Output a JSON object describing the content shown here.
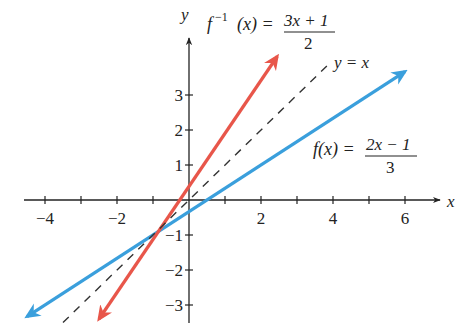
{
  "chart_data": {
    "type": "line",
    "title": "",
    "xlabel": "x",
    "ylabel": "y",
    "xlim": [
      -4.5,
      6.8
    ],
    "ylim": [
      -3.5,
      4.5
    ],
    "x_ticks": [
      -4,
      -3,
      -2,
      -1,
      0,
      1,
      2,
      3,
      4,
      5,
      6
    ],
    "x_tick_labels": {
      "-4": "−4",
      "-2": "−2",
      "2": "2",
      "4": "4",
      "6": "6"
    },
    "y_ticks": [
      -3,
      -2,
      -1,
      1,
      2,
      3
    ],
    "y_tick_labels": {
      "-3": "−3",
      "-2": "−2",
      "-1": "−1",
      "1": "1",
      "2": "2",
      "3": "3"
    },
    "grid": false,
    "series": [
      {
        "name": "f(x) = (2x − 1)/3",
        "color": "#3a9fdc",
        "style": "solid",
        "x": [
          -4.5,
          6.0
        ],
        "y": [
          -3.33,
          3.67
        ],
        "arrows": "both"
      },
      {
        "name": "f⁻¹(x) = (3x + 1)/2",
        "color": "#e8564a",
        "style": "solid",
        "x": [
          -2.5,
          2.45
        ],
        "y": [
          -3.4,
          4.1
        ],
        "arrows": "both"
      },
      {
        "name": "y = x",
        "color": "#333333",
        "style": "dashed",
        "x": [
          -3.5,
          3.9
        ],
        "y": [
          -3.5,
          3.9
        ],
        "arrows": "none"
      }
    ],
    "intersection": {
      "x": -1,
      "y": -1
    },
    "annotations": [
      {
        "text": "f⁻¹(x) = (3x + 1)/2",
        "near": "top center"
      },
      {
        "text": "y = x",
        "near": "top right of dashed line"
      },
      {
        "text": "f(x) = (2x − 1)/3",
        "near": "right, above x-axis"
      }
    ]
  },
  "labels": {
    "x_axis": "x",
    "y_axis": "y",
    "finv_lhs_f": "f",
    "finv_lhs_sup": "−1",
    "finv_lhs_arg": "(x) =",
    "finv_num": "3x + 1",
    "finv_den": "2",
    "yx": "y = x",
    "f_lhs": "f(x) =",
    "f_num": "2x − 1",
    "f_den": "3"
  }
}
